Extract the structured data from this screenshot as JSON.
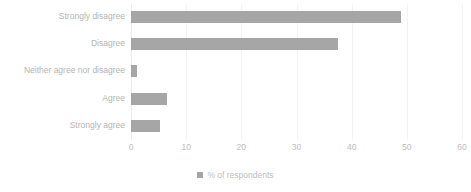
{
  "chart_data": {
    "type": "bar",
    "orientation": "horizontal",
    "title": "",
    "subtitle": "",
    "xlabel": "",
    "ylabel": "",
    "categories": [
      "Strongly disagree",
      "Disagree",
      "Neither agree nor disagree",
      "Agree",
      "Strongly agree"
    ],
    "values": [
      49,
      37.5,
      1,
      6.5,
      5.3
    ],
    "series": [
      {
        "name": "% of respondents",
        "values": [
          49,
          37.5,
          1,
          6.5,
          5.3
        ]
      }
    ],
    "xlim": [
      0,
      60
    ],
    "xticks": [
      0,
      10,
      20,
      30,
      40,
      50,
      60
    ],
    "xtick_labels": [
      "0",
      "10",
      "20",
      "30",
      "40",
      "50",
      "60"
    ],
    "grid": true,
    "grid_axis": "x",
    "legend": [
      "% of respondents"
    ],
    "legend_position": "bottom-center",
    "bar_color": "#a6a6a6",
    "text_color": "#bdbdbd",
    "gridline_color": "#f2f2f2",
    "background_color": "#ffffff"
  },
  "legend": {
    "label": "% of respondents",
    "swatch_icon": "legend-square-icon",
    "swatch_color": "#a6a6a6"
  }
}
